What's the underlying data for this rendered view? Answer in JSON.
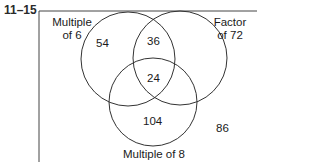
{
  "problem_number": "11–15",
  "venn": {
    "sets": [
      {
        "name": "Multiple of 6",
        "label_line1": "Multiple",
        "label_line2": "of 6"
      },
      {
        "name": "Factor of 72",
        "label_line1": "Factor",
        "label_line2": "of 72"
      },
      {
        "name": "Multiple of 8",
        "label": "Multiple of 8"
      }
    ],
    "regions": {
      "only_multiple_of_6": "54",
      "multiple_of_6_and_factor_of_72": "36",
      "all_three": "24",
      "only_multiple_of_8": "104",
      "outside": "86"
    }
  },
  "colors": {
    "line": "#333333",
    "background": "#ffffff"
  }
}
